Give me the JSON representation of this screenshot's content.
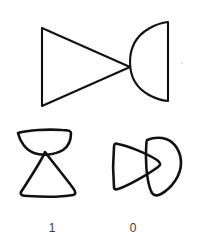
{
  "figure": {
    "background_color": "#ffffff",
    "stroke_color": "#111111",
    "label_color": "#3a3a3a"
  },
  "prompt_panel": {
    "name": "reference-composition",
    "description": "Reference figure: right-pointing triangle joined at its apex to a D-shape (semicircle with flat vertical right edge)",
    "parts": [
      {
        "name": "triangle",
        "shape": "triangle",
        "orientation": "points-right",
        "style": "clean",
        "points": "42,28 42,106 130,67"
      },
      {
        "name": "d-shape",
        "shape": "semicircle",
        "orientation": "flat-edge-right",
        "style": "clean",
        "path": "M168,22 L168,101 C168,101 130,98 130,62 C130,26 168,22 168,22 Z"
      }
    ]
  },
  "options": [
    {
      "name": "option-one",
      "label": "1",
      "label_x": 52,
      "label_y": 232,
      "description": "Hand-drawn D-shape rotated so its flat edge is on top, sitting above a hand-drawn triangle pointing up; the two touch at a single point",
      "parts": [
        {
          "name": "bowl-d-shape",
          "shape": "semicircle",
          "orientation": "flat-edge-top",
          "style": "sketch",
          "path": "M18,133 C28,130 48,129 62,130 C68,130 71,131 71,133 C71,140 69,146 63,150 C55,155 42,156 34,153 C26,150 20,142 18,133 Z"
        },
        {
          "name": "triangle-up",
          "shape": "triangle",
          "orientation": "points-up",
          "style": "sketch",
          "path": "M45,152 C42,160 30,178 21,192 C20,195 22,196 28,196 C42,197 62,197 73,195 C76,194 76,192 73,188 C64,176 51,160 45,152 Z"
        }
      ]
    },
    {
      "name": "option-zero",
      "label": "0",
      "label_x": 133,
      "label_y": 232,
      "description": "Hand-drawn triangle pointing right overlapping a hand-drawn D-shape whose flat edge is on the left; the two shapes intersect rather than meeting at a point",
      "parts": [
        {
          "name": "triangle-right",
          "shape": "triangle",
          "orientation": "points-right",
          "style": "sketch",
          "path": "M114,147 C113,158 113,176 114,187 C114,190 116,190 121,188 C133,183 150,173 158,167 C161,165 161,163 157,160 C146,153 128,146 118,144 C115,143 114,144 114,147 Z"
        },
        {
          "name": "d-shape-overlap",
          "shape": "semicircle",
          "orientation": "flat-edge-left",
          "style": "sketch",
          "path": "M147,140 C152,138 160,137 166,139 C175,142 181,152 181,163 C181,175 172,188 161,194 C157,196 154,196 152,193 C148,186 146,170 146,158 C146,149 146,142 147,140 Z"
        }
      ]
    }
  ],
  "marks": [
    {
      "name": "speck-mark",
      "x": 182,
      "y": 63,
      "r": 1.1
    }
  ]
}
